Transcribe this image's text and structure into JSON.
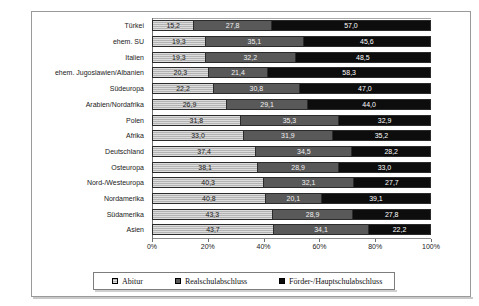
{
  "chart_data": {
    "type": "bar",
    "orientation": "horizontal",
    "stacked": true,
    "stack_mode": "percent",
    "title": "",
    "xlabel": "",
    "ylabel": "",
    "xlim": [
      0,
      100
    ],
    "xticks": [
      "0%",
      "20%",
      "40%",
      "60%",
      "80%",
      "100%"
    ],
    "xtick_values": [
      0,
      20,
      40,
      60,
      80,
      100
    ],
    "grid": false,
    "legend_position": "bottom",
    "categories": [
      "Türkei",
      "ehem. SU",
      "Italien",
      "ehem. Jugoslawien/Albanien",
      "Südeuropa",
      "Arabien/Nordafrika",
      "Polen",
      "Afrika",
      "Deutschland",
      "Osteuropa",
      "Nord-/Westeuropa",
      "Nordamerika",
      "Südamerika",
      "Asien"
    ],
    "series": [
      {
        "name": "Abitur",
        "color": "#b3b3b3",
        "values": [
          15.2,
          19.3,
          19.3,
          20.3,
          22.2,
          26.9,
          31.8,
          33.0,
          37.4,
          38.1,
          40.3,
          40.8,
          43.3,
          43.7
        ],
        "labels": [
          "15,2",
          "19,3",
          "19,3",
          "20,3",
          "22,2",
          "26,9",
          "31,8",
          "33,0",
          "37,4",
          "38,1",
          "40,3",
          "40,8",
          "43,3",
          "43,7"
        ]
      },
      {
        "name": "Realschulabschluss",
        "color": "#595959",
        "values": [
          27.8,
          35.1,
          32.2,
          21.4,
          30.8,
          29.1,
          35.3,
          31.9,
          34.5,
          28.9,
          32.1,
          20.1,
          28.9,
          34.1
        ],
        "labels": [
          "27,8",
          "35,1",
          "32,2",
          "21,4",
          "30,8",
          "29,1",
          "35,3",
          "31,9",
          "34,5",
          "28,9",
          "32,1",
          "20,1",
          "28,9",
          "34,1"
        ]
      },
      {
        "name": "Förder-/Hauptschulabschluss",
        "color": "#0d0d0d",
        "values": [
          57.0,
          45.6,
          48.5,
          58.3,
          47.0,
          44.0,
          32.9,
          35.2,
          28.2,
          33.0,
          27.7,
          39.1,
          27.8,
          22.2
        ],
        "labels": [
          "57,0",
          "45,6",
          "48,5",
          "58,3",
          "47,0",
          "44,0",
          "32,9",
          "35,2",
          "28,2",
          "33,0",
          "27,7",
          "39,1",
          "27,8",
          "22,2"
        ]
      }
    ],
    "legend": [
      {
        "label": "Abitur",
        "color": "#b3b3b3"
      },
      {
        "label": "Realschulabschluss",
        "color": "#595959"
      },
      {
        "label": "Förder-/Hauptschulabschluss",
        "color": "#0d0d0d"
      }
    ]
  }
}
